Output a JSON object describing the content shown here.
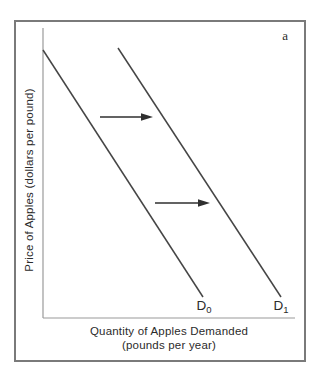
{
  "figure": {
    "panel_label": "a"
  },
  "chart_data": {
    "type": "line",
    "title": "",
    "xlabel_line1": "Quantity of Apples Demanded",
    "xlabel_line2": "(pounds per year)",
    "ylabel": "Price of Apples (dollars per pound)",
    "axes_numeric_ticks": false,
    "grid": false,
    "series": [
      {
        "name": "D0",
        "label_base": "D",
        "label_sub": "0",
        "description": "original demand curve, downward sloping",
        "points_px": [
          [
            27,
            28
          ],
          [
            187,
            275
          ]
        ]
      },
      {
        "name": "D1",
        "label_base": "D",
        "label_sub": "1",
        "description": "demand curve after rightward shift (increase in demand)",
        "points_px": [
          [
            102,
            26
          ],
          [
            265,
            275
          ]
        ]
      }
    ],
    "annotations": [
      {
        "type": "arrow",
        "direction": "right",
        "from_px": [
          84,
          95
        ],
        "to_px": [
          137,
          95
        ]
      },
      {
        "type": "arrow",
        "direction": "right",
        "from_px": [
          139,
          181
        ],
        "to_px": [
          194,
          181
        ]
      }
    ],
    "axes_px": {
      "origin": [
        27,
        296
      ],
      "y_top": [
        27,
        6
      ],
      "x_right": [
        279,
        296
      ]
    },
    "colors": {
      "curve": "#454545",
      "axis": "#9a9a9a",
      "arrow": "#2f2f2f",
      "border": "#7a7a7a",
      "text": "#2b2b2b"
    }
  }
}
